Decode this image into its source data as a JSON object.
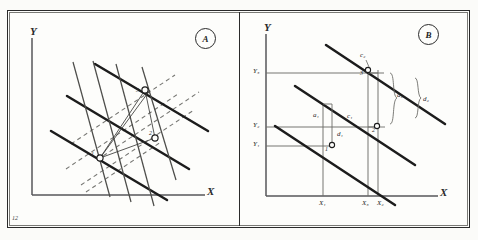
{
  "figure": {
    "page_number": "12",
    "panels": [
      {
        "tag": "A",
        "axis_x_label": "X",
        "axis_y_label": "Y",
        "point_labels": [
          "1",
          "2",
          "3"
        ]
      },
      {
        "tag": "B",
        "axis_x_label": "X",
        "axis_y_label": "Y",
        "y_ticks": [
          "Y1",
          "Y2",
          "Y3"
        ],
        "y_tick_html": [
          "Y₁",
          "Y₂",
          "Y₃"
        ],
        "x_ticks": [
          "X1",
          "X3",
          "X2"
        ],
        "x_tick_html": [
          "X₁",
          "X₃",
          "X₂"
        ],
        "point_labels": [
          "1",
          "2",
          "3"
        ],
        "segment_labels": [
          "a1",
          "c1",
          "d1",
          "a2",
          "c2",
          "d2"
        ],
        "segment_label_html": [
          "a₁",
          "c₁",
          "d₁",
          "a₂",
          "c₂",
          "d₂"
        ]
      }
    ],
    "colors": {
      "ink": "#2a2a2a",
      "thick_line": "#1c1c1c",
      "thin_line": "#555552",
      "dashed_line": "#6a6a66",
      "grid_line": "#6e6e6a",
      "paper": "#fdfdfb"
    }
  }
}
